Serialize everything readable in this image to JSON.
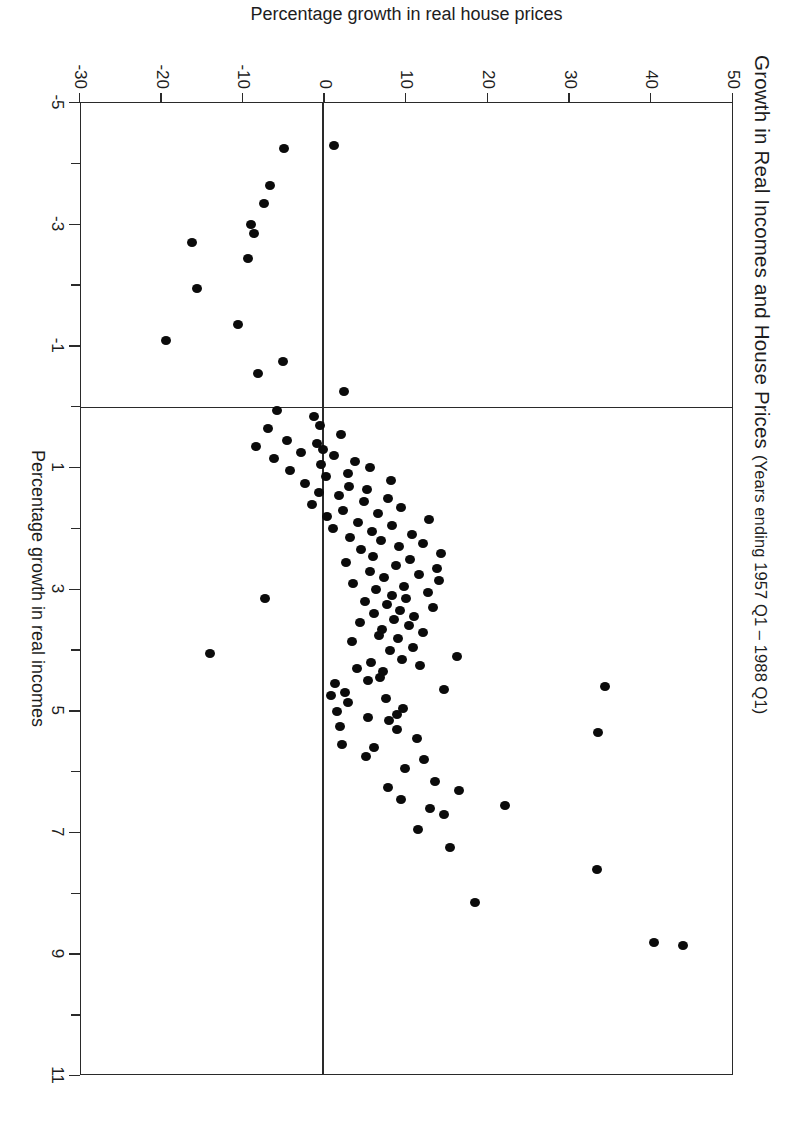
{
  "chart_data": {
    "type": "scatter",
    "title": "Growth in Real Incomes and House Prices",
    "subtitle": "(Years ending 1957 Q1 – 1988 Q1)",
    "xlabel": "Percentage growth in real incomes",
    "ylabel": "Percentage growth in real house prices",
    "xlim": [
      -5,
      11
    ],
    "ylim": [
      -30,
      50
    ],
    "x_major_ticks": [
      -5,
      -3,
      -1,
      1,
      3,
      5,
      7,
      9,
      11
    ],
    "x_minor_ticks": [
      -4,
      -2,
      0,
      2,
      4,
      6,
      8,
      10
    ],
    "y_ticks": [
      50,
      40,
      30,
      20,
      10,
      0,
      -10,
      -20,
      -30
    ],
    "x_tick_labels": [
      "-5",
      "-3",
      "-1",
      "1",
      "3",
      "5",
      "7",
      "9",
      "11"
    ],
    "y_tick_labels": [
      "50",
      "40",
      "30",
      "20",
      "10",
      "0",
      "-10",
      "-20",
      "-30"
    ],
    "grid": false,
    "legend": false,
    "reference_lines": [
      {
        "axis": "x",
        "value": 0,
        "label": "zero real income growth"
      },
      {
        "axis": "y",
        "value": 0,
        "label": "zero real house price growth"
      }
    ],
    "marker": {
      "shape": "circle",
      "color": "#0b0b0b",
      "size": 9
    },
    "n_points": 125,
    "points": [
      [
        6.55,
        22.2
      ],
      [
        8.15,
        18.5
      ],
      [
        8.85,
        44.0
      ],
      [
        8.8,
        40.5
      ],
      [
        7.6,
        33.5
      ],
      [
        7.25,
        15.5
      ],
      [
        6.95,
        11.5
      ],
      [
        6.7,
        14.7
      ],
      [
        6.6,
        13.0
      ],
      [
        6.45,
        9.4
      ],
      [
        6.3,
        16.5
      ],
      [
        6.25,
        7.8
      ],
      [
        6.15,
        13.6
      ],
      [
        5.95,
        9.9
      ],
      [
        5.8,
        12.3
      ],
      [
        5.75,
        5.1
      ],
      [
        5.6,
        6.1
      ],
      [
        5.55,
        2.2
      ],
      [
        5.45,
        11.4
      ],
      [
        5.35,
        33.6
      ],
      [
        5.3,
        8.9
      ],
      [
        5.25,
        2.0
      ],
      [
        5.15,
        8.0
      ],
      [
        5.1,
        5.4
      ],
      [
        5.05,
        9.0
      ],
      [
        5.0,
        1.6
      ],
      [
        4.95,
        9.7
      ],
      [
        4.85,
        3.0
      ],
      [
        4.8,
        7.6
      ],
      [
        4.75,
        0.9
      ],
      [
        4.7,
        2.6
      ],
      [
        4.65,
        14.7
      ],
      [
        4.6,
        34.5
      ],
      [
        4.55,
        1.4
      ],
      [
        4.5,
        5.4
      ],
      [
        4.45,
        6.9
      ],
      [
        4.35,
        7.3
      ],
      [
        4.3,
        4.0
      ],
      [
        4.25,
        11.8
      ],
      [
        4.2,
        5.8
      ],
      [
        4.15,
        9.6
      ],
      [
        4.1,
        16.3
      ],
      [
        4.0,
        8.1
      ],
      [
        3.95,
        10.9
      ],
      [
        3.85,
        3.4
      ],
      [
        3.8,
        9.1
      ],
      [
        3.75,
        6.7
      ],
      [
        3.7,
        12.2
      ],
      [
        3.65,
        7.1
      ],
      [
        3.6,
        10.4
      ],
      [
        3.55,
        4.4
      ],
      [
        3.5,
        8.6
      ],
      [
        3.45,
        11.0
      ],
      [
        3.4,
        6.2
      ],
      [
        3.35,
        9.3
      ],
      [
        3.3,
        13.4
      ],
      [
        3.25,
        7.7
      ],
      [
        3.2,
        5.0
      ],
      [
        3.15,
        10.1
      ],
      [
        3.1,
        8.3
      ],
      [
        3.05,
        12.7
      ],
      [
        3.0,
        6.4
      ],
      [
        2.95,
        9.8
      ],
      [
        2.9,
        3.6
      ],
      [
        2.85,
        14.1
      ],
      [
        2.8,
        7.4
      ],
      [
        2.75,
        11.6
      ],
      [
        2.7,
        5.6
      ],
      [
        2.65,
        13.9
      ],
      [
        2.6,
        8.8
      ],
      [
        2.55,
        2.7
      ],
      [
        2.5,
        10.6
      ],
      [
        2.45,
        6.0
      ],
      [
        2.4,
        14.4
      ],
      [
        2.35,
        4.6
      ],
      [
        2.3,
        9.2
      ],
      [
        2.25,
        12.1
      ],
      [
        2.2,
        7.0
      ],
      [
        2.15,
        3.2
      ],
      [
        2.1,
        10.8
      ],
      [
        2.05,
        5.9
      ],
      [
        2.0,
        1.1
      ],
      [
        1.95,
        8.4
      ],
      [
        1.9,
        4.2
      ],
      [
        1.85,
        12.9
      ],
      [
        1.8,
        0.4
      ],
      [
        1.75,
        6.6
      ],
      [
        1.7,
        2.4
      ],
      [
        1.65,
        9.5
      ],
      [
        1.6,
        -1.5
      ],
      [
        1.55,
        4.9
      ],
      [
        1.5,
        7.9
      ],
      [
        1.45,
        1.8
      ],
      [
        1.4,
        -0.6
      ],
      [
        1.35,
        5.3
      ],
      [
        1.3,
        3.1
      ],
      [
        1.25,
        -2.3
      ],
      [
        1.2,
        8.2
      ],
      [
        1.15,
        0.2
      ],
      [
        1.1,
        2.9
      ],
      [
        1.05,
        -4.1
      ],
      [
        1.0,
        5.7
      ],
      [
        0.95,
        -0.3
      ],
      [
        0.9,
        3.8
      ],
      [
        0.85,
        -6.1
      ],
      [
        0.8,
        1.3
      ],
      [
        0.75,
        -2.8
      ],
      [
        0.7,
        -0.1
      ],
      [
        0.65,
        -8.3
      ],
      [
        0.6,
        -0.9
      ],
      [
        0.55,
        -4.5
      ],
      [
        0.45,
        2.1
      ],
      [
        0.3,
        -0.5
      ],
      [
        0.15,
        -1.2
      ],
      [
        0.05,
        -5.7
      ],
      [
        -0.25,
        2.5
      ],
      [
        -0.55,
        -8.1
      ],
      [
        -0.75,
        -5.0
      ],
      [
        -1.1,
        -19.4
      ],
      [
        -1.35,
        -10.5
      ],
      [
        -1.95,
        -15.6
      ],
      [
        -2.45,
        -9.3
      ],
      [
        -2.7,
        -16.2
      ],
      [
        -2.85,
        -8.6
      ],
      [
        -3.0,
        -8.9
      ],
      [
        -3.35,
        -7.3
      ],
      [
        -3.65,
        -6.6
      ],
      [
        -4.25,
        -4.9
      ],
      [
        -4.3,
        1.2
      ],
      [
        4.05,
        -13.9
      ],
      [
        3.15,
        -7.2
      ],
      [
        0.35,
        -6.8
      ]
    ]
  }
}
